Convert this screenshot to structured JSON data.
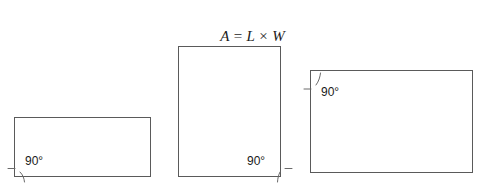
{
  "figure": {
    "title_formula": {
      "full_text": "A = L × W",
      "area_symbol": "A",
      "equals": " = ",
      "length_symbol": "L",
      "times": " × ",
      "width_symbol": "W"
    },
    "background_color": "#ffffff",
    "stroke_color": "#5a5a5a",
    "text_color": "#1a1a1a",
    "shapes": [
      {
        "id": "rectangle-1",
        "name": "small-wide-rectangle",
        "x": 14,
        "y": 117,
        "width": 137,
        "height": 60,
        "angle_label": "90°",
        "angle_corner": "bottom-left"
      },
      {
        "id": "rectangle-2",
        "name": "tall-rectangle",
        "x": 178,
        "y": 46,
        "width": 103,
        "height": 131,
        "angle_label": "90°",
        "angle_corner": "bottom-right"
      },
      {
        "id": "rectangle-3",
        "name": "large-wide-rectangle",
        "x": 310,
        "y": 70,
        "width": 163,
        "height": 103,
        "angle_label": "90°",
        "angle_corner": "top-left"
      }
    ]
  }
}
